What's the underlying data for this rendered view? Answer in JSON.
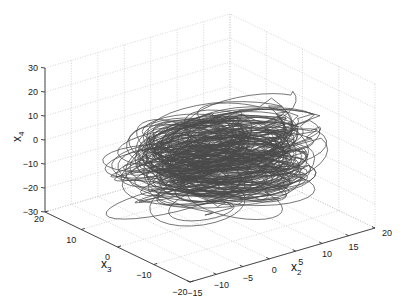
{
  "chart_data": {
    "type": "line3d",
    "title": "",
    "axes": {
      "x": {
        "label": "x",
        "subscript": "2",
        "range": [
          -15,
          20
        ],
        "ticks": [
          -15,
          -10,
          -5,
          0,
          5,
          10,
          15,
          20
        ]
      },
      "y": {
        "label": "x",
        "subscript": "3",
        "range": [
          -20,
          20
        ],
        "ticks": [
          -20,
          -10,
          0,
          10,
          20
        ]
      },
      "z": {
        "label": "x",
        "subscript": "4",
        "range": [
          -30,
          30
        ],
        "ticks": [
          -30,
          -20,
          -10,
          0,
          10,
          20,
          30
        ]
      }
    },
    "grid": true,
    "grid_style": "dotted",
    "line_color": "#4a4a4a",
    "trajectory_extent": {
      "x2": [
        -12,
        16
      ],
      "x3": [
        -15,
        15
      ],
      "x4": [
        -25,
        15
      ]
    }
  },
  "labels": {
    "x2_label": "x",
    "x2_sub": "2",
    "x3_label": "x",
    "x3_sub": "3",
    "x4_label": "x",
    "x4_sub": "4"
  }
}
